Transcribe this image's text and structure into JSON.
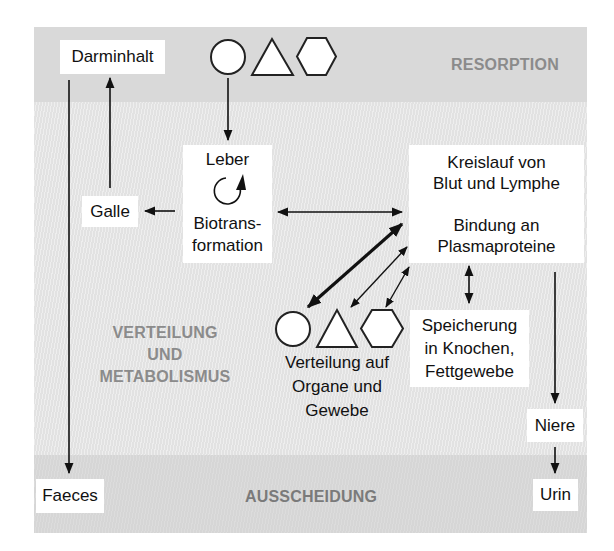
{
  "zones": {
    "resorption": "RESORPTION",
    "verteilung": [
      "VERTEILUNG",
      "UND",
      "METABOLISMUS"
    ],
    "ausscheidung": "AUSSCHEIDUNG"
  },
  "boxes": {
    "darminhalt": "Darminhalt",
    "leber": {
      "title": "Leber",
      "icon": "rotation-cycle-icon",
      "lines": [
        "Biotrans-",
        "formation"
      ]
    },
    "galle": "Galle",
    "kreislauf": {
      "lines": [
        "Kreislauf von",
        "Blut und Lymphe",
        "",
        "Bindung an",
        "Plasmaproteine"
      ]
    },
    "speicherung": {
      "lines": [
        "Speicherung",
        "in Knochen,",
        "Fettgewebe"
      ]
    },
    "niere": "Niere",
    "faeces": "Faeces",
    "urin": "Urin"
  },
  "distribution_label": [
    "Verteilung auf",
    "Organe und",
    "Gewebe"
  ],
  "substance_shapes": [
    "circle-icon",
    "triangle-icon",
    "hexagon-icon"
  ],
  "colors": {
    "resorption_band": "#d9d9d9",
    "middle_band": "#e4e4e4",
    "excretion_band": "#d8d8d8",
    "zone_label": "#8b8b8b",
    "arrow": "#111111",
    "box": "#ffffff"
  }
}
